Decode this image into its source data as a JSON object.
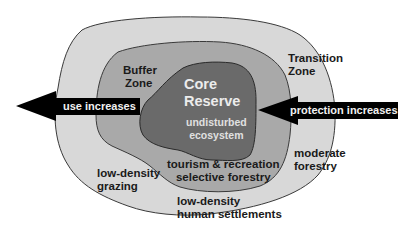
{
  "zones": {
    "transition": {
      "title_line1": "Transition",
      "title_line2": "Zone",
      "color": "#d8d8d8"
    },
    "buffer": {
      "title_line1": "Buffer",
      "title_line2": "Zone",
      "color": "#a9a9a9"
    },
    "core": {
      "title_line1": "Core",
      "title_line2": "Reserve",
      "sub_line1": "undisturbed",
      "sub_line2": "ecosystem",
      "color": "#6a6a6a"
    }
  },
  "activities": {
    "buffer_line1": "tourism & recreation",
    "buffer_line2": "selective forestry",
    "grazing_line1": "low-density",
    "grazing_line2": "grazing",
    "settlements_line1": "low-density",
    "settlements_line2": "human settlements",
    "forestry_line1": "moderate",
    "forestry_line2": "forestry"
  },
  "arrows": {
    "left": {
      "label": "use increases",
      "direction": "left",
      "color": "#000000"
    },
    "right": {
      "label": "protection increases",
      "direction": "left",
      "color": "#000000"
    }
  }
}
